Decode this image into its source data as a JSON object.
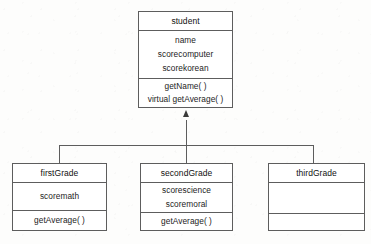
{
  "diagram": {
    "type": "uml-class-diagram",
    "relationship": "generalization",
    "classes": [
      {
        "id": "student",
        "name": "student",
        "role": "base-class",
        "attributes": [
          "name",
          "scorecomputer",
          "scorekorean"
        ],
        "operations": [
          "getName(  )",
          "virtual getAverage(  )"
        ]
      },
      {
        "id": "firstGrade",
        "name": "firstGrade",
        "role": "derived-class",
        "attributes": [
          "scoremath"
        ],
        "operations": [
          "getAverage(  )"
        ]
      },
      {
        "id": "secondGrade",
        "name": "secondGrade",
        "role": "derived-class",
        "attributes": [
          "scorescience",
          "scoremoral"
        ],
        "operations": [
          "getAverage(  )"
        ]
      },
      {
        "id": "thirdGrade",
        "name": "thirdGrade",
        "role": "derived-class",
        "attributes": [],
        "operations": []
      }
    ],
    "connectors": [
      {
        "from": "firstGrade",
        "to": "student",
        "kind": "inheritance"
      },
      {
        "from": "secondGrade",
        "to": "student",
        "kind": "inheritance"
      },
      {
        "from": "thirdGrade",
        "to": "student",
        "kind": "inheritance"
      }
    ],
    "colors": {
      "line": "#5d5d5d",
      "text": "#1c1c1c",
      "background": "#fdfdfc",
      "fill": "#ffffff"
    }
  }
}
